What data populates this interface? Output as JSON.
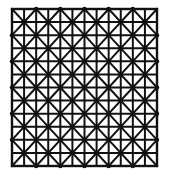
{
  "diagram": {
    "title": "",
    "columns": 6,
    "rows": 6,
    "subdivisions_per_cell": 2,
    "diagonals": "both",
    "node_markers": true,
    "line_color": "#111111",
    "background_color": "#ffffff"
  }
}
